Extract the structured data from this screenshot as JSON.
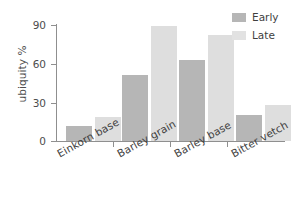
{
  "chart_data": {
    "type": "bar",
    "title": "",
    "xlabel": "",
    "ylabel": "ubiquity %",
    "categories": [
      "Einkorn base",
      "Barley grain",
      "Barley base",
      "Bitter vetch"
    ],
    "series": [
      {
        "name": "Early",
        "color": "#b6b6b6",
        "values": [
          12,
          51,
          63,
          20
        ]
      },
      {
        "name": "Late",
        "color": "#dedede",
        "values": [
          19,
          89,
          82,
          28
        ]
      }
    ],
    "ylim": [
      0,
      90
    ],
    "yticks": [
      0,
      30,
      60,
      90
    ],
    "ytick_labels": [
      "0",
      "30",
      "60",
      "90"
    ],
    "grid": false,
    "legend_position": "top-right",
    "legend_entries": [
      "Early",
      "Late"
    ]
  },
  "axis": {
    "y_title": "ubiquity %",
    "y_tick_labels": [
      "90",
      "60",
      "30",
      "0"
    ],
    "x_tick_labels": [
      "Einkorn base",
      "Barley grain",
      "Barley base",
      "Bitter vetch"
    ]
  },
  "legend": {
    "items": [
      {
        "label": "Early"
      },
      {
        "label": "Late"
      }
    ]
  }
}
